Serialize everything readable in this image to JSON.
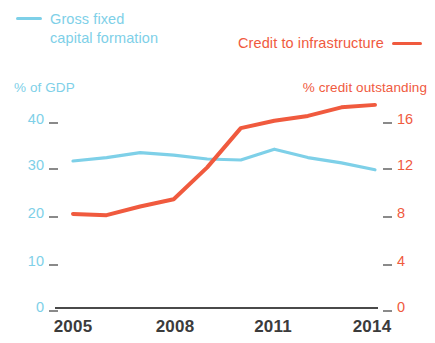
{
  "legend": {
    "series_blue_label": "Gross fixed\ncapital formation",
    "series_red_label": "Credit to infrastructure"
  },
  "axes": {
    "left_title": "% of GDP",
    "right_title": "% credit outstanding",
    "left_ticks": [
      "40",
      "30",
      "20",
      "10",
      "0"
    ],
    "right_ticks": [
      "16",
      "12",
      "8",
      "4",
      "0"
    ],
    "x_ticks": [
      "2005",
      "2008",
      "2011",
      "2014"
    ]
  },
  "colors": {
    "blue": "#7ed0e8",
    "red": "#f05a3e",
    "axis": "#4a4a4a",
    "xlabel": "#3b3b3b"
  },
  "chart_data": {
    "type": "line",
    "title": "",
    "xlabel": "",
    "ylabel": "% of GDP",
    "y2label": "% credit outstanding",
    "grid": false,
    "legend_position": "top",
    "x": [
      2005,
      2006,
      2007,
      2008,
      2009,
      2010,
      2011,
      2012,
      2013,
      2014
    ],
    "xlim": [
      2005,
      2014
    ],
    "ylim": [
      0,
      40
    ],
    "y2lim": [
      0,
      16
    ],
    "x_tick_labels": [
      "2005",
      "2008",
      "2011",
      "2014"
    ],
    "y_tick_values": [
      40,
      30,
      20,
      10,
      0
    ],
    "y2_tick_values": [
      16,
      12,
      8,
      4,
      0
    ],
    "series": [
      {
        "name": "Gross fixed capital formation",
        "axis": "left",
        "unit": "% of GDP",
        "color": "#7ed0e8",
        "values": [
          29.8,
          30.5,
          31.5,
          31.0,
          30.2,
          30.0,
          32.2,
          30.5,
          29.4,
          28.0
        ]
      },
      {
        "name": "Credit to infrastructure",
        "axis": "right",
        "unit": "% credit outstanding",
        "color": "#f05a3e",
        "values": [
          7.6,
          7.5,
          8.2,
          8.8,
          11.4,
          14.6,
          15.2,
          15.6,
          16.3,
          16.5
        ]
      }
    ]
  }
}
